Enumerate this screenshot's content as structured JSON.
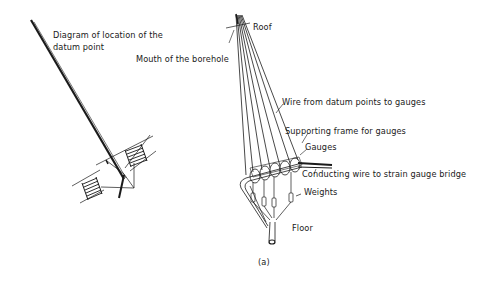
{
  "figure": {
    "caption": "(a)",
    "colors": {
      "ink": "#1a1a1a",
      "background": "#ffffff"
    }
  },
  "left_diagram": {
    "title_line1": "Diagram of location of the",
    "title_line2": "datum point"
  },
  "right_diagram": {
    "labels": {
      "roof": "Roof",
      "mouth": "Mouth of the borehole",
      "wire": "Wire from datum points to gauges",
      "frame": "Supporting frame for gauges",
      "gauges": "Gauges",
      "conducting": "Conducting wire to strain gauge bridge",
      "weights": "Weights",
      "floor": "Floor"
    }
  }
}
